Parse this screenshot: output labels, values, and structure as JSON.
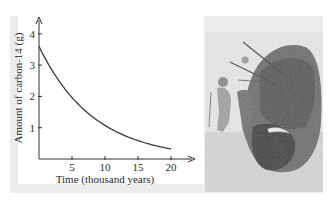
{
  "chart_data": {
    "type": "line",
    "title": "",
    "xlabel": "Time (thousand years)",
    "ylabel": "Amount of carbon-14 (g)",
    "x_ticks": [
      5,
      10,
      15,
      20
    ],
    "y_ticks": [
      1,
      2,
      3,
      4
    ],
    "xlim": [
      0,
      20
    ],
    "ylim": [
      0,
      4
    ],
    "grid": false,
    "legend": null,
    "series": [
      {
        "name": "carbon-14 remaining",
        "x": [
          0,
          2.5,
          5,
          7.5,
          10,
          12.5,
          15,
          17.5,
          20
        ],
        "values": [
          3.6,
          2.65,
          1.98,
          1.46,
          1.07,
          0.79,
          0.58,
          0.43,
          0.32
        ]
      }
    ],
    "annotations": []
  },
  "labels": {
    "xlabel": "Time (thousand years)",
    "ylabel": "Amount of carbon-14 (g)",
    "x_tick_labels": [
      "5",
      "10",
      "15",
      "20"
    ],
    "y_tick_labels": [
      "1",
      "2",
      "3",
      "4"
    ]
  },
  "illustration": {
    "subject": "prehistoric hunters spearing a bison"
  },
  "colors": {
    "panel": "#ececec",
    "axis": "#333333",
    "curve": "#3a3a3a",
    "text": "#2a2a2a"
  }
}
